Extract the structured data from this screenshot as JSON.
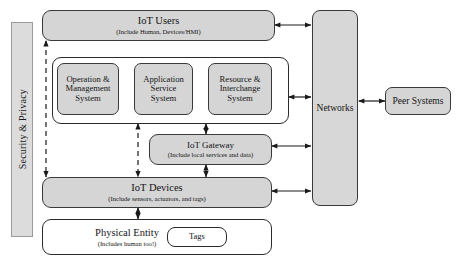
{
  "diagram": {
    "colors": {
      "box_fill": "#d5d5d5",
      "panel_fill": "#ffffff",
      "border": "#2b2b2b",
      "security_fill": "#dcdcdc",
      "connector": "#1a1a1a"
    },
    "security_band": {
      "label": "Security & Privacy",
      "orientation": "vertical"
    },
    "nodes": {
      "iot_users": {
        "title": "IoT Users",
        "subtitle": "(Include Human, Devices/HMI)"
      },
      "systems_panel": {
        "boxes": [
          {
            "line1": "Operation &",
            "line2": "Management",
            "line3": "System"
          },
          {
            "line1": "Application",
            "line2": "Service",
            "line3": "System"
          },
          {
            "line1": "Resource &",
            "line2": "Interchange",
            "line3": "System"
          }
        ]
      },
      "iot_gateway": {
        "title": "IoT Gateway",
        "subtitle": "(Include local services and data)"
      },
      "iot_devices": {
        "title": "IoT Devices",
        "subtitle": "(Include sensors, actuators, and tags)"
      },
      "physical_entity": {
        "title": "Physical Entity",
        "subtitle": "(Includes human too!)",
        "tags_label": "Tags"
      },
      "networks": {
        "label": "Networks"
      },
      "peer_systems": {
        "label": "Peer Systems"
      }
    },
    "connectors": [
      {
        "name": "users-to-networks",
        "style": "solid",
        "arrows": "both"
      },
      {
        "name": "systems-to-networks",
        "style": "solid",
        "arrows": "both"
      },
      {
        "name": "gateway-to-networks",
        "style": "solid",
        "arrows": "both"
      },
      {
        "name": "devices-to-networks",
        "style": "solid",
        "arrows": "both"
      },
      {
        "name": "networks-to-peer-systems",
        "style": "solid",
        "arrows": "both"
      },
      {
        "name": "users-to-devices-dashed",
        "style": "dashed",
        "arrows": "both"
      },
      {
        "name": "systems-to-devices-dashed",
        "style": "dashed",
        "arrows": "both"
      },
      {
        "name": "systems-to-gateway",
        "style": "solid",
        "arrows": "both"
      },
      {
        "name": "gateway-to-devices",
        "style": "solid",
        "arrows": "both"
      },
      {
        "name": "devices-to-physical-entity",
        "style": "solid",
        "arrows": "both"
      }
    ]
  }
}
